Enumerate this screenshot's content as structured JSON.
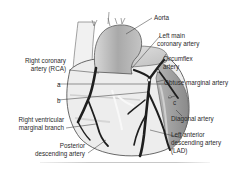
{
  "diagram": {
    "labels": {
      "aorta": "Aorta",
      "left_main_1": "Left main",
      "left_main_2": "coronary artery",
      "circumflex_1": "Circumflex",
      "circumflex_2": "artery",
      "obtuse_marginal": "Obtuse marginal  artery",
      "c": "c",
      "diagonal": "Diagonal artery",
      "lad_1": "Left anterior",
      "lad_2": "descending artery",
      "lad_3": "(LAD)",
      "rca_1": "Right coronary",
      "rca_2": "artery (RCA)",
      "a": "a",
      "b": "b",
      "rv_marginal_1": "Right ventricular",
      "rv_marginal_2": "marginal branch",
      "pda_1": "Posterior",
      "pda_2": "descending artery"
    },
    "colors": {
      "artery": "#1e1e1e",
      "heart_light": "#ececec",
      "heart_mid": "#c9c9c9",
      "heart_dark": "#8e8e8e",
      "outline": "#555555",
      "leader": "#333333"
    }
  }
}
